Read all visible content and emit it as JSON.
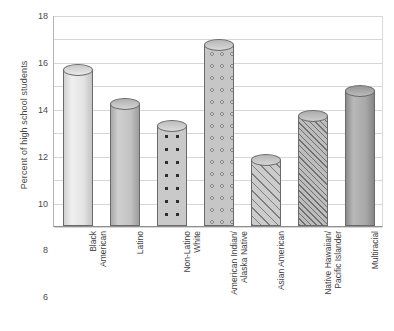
{
  "chart_data": {
    "type": "bar",
    "title": "",
    "xlabel": "",
    "ylabel": "Percent of high school students",
    "ylim": [
      0,
      18
    ],
    "ytick_step": 2,
    "grid": true,
    "legend": "none",
    "yticks": [
      "18",
      "16",
      "14",
      "12",
      "10",
      "8",
      "6",
      "4",
      "2",
      "0"
    ],
    "categories": [
      "Black American",
      "Latino",
      "Non-Latino White",
      "American Indian/ Alaska Native",
      "Asian American",
      "Native Hawaiian/ Pacific Islander",
      "Multiracial"
    ],
    "category_lines": [
      [
        "Black",
        "American"
      ],
      [
        "Latino"
      ],
      [
        "Non-Latino",
        "White"
      ],
      [
        "American Indian/",
        "Alaska Native"
      ],
      [
        "Asian American"
      ],
      [
        "Native Hawaiian/",
        "Pacific Islander"
      ],
      [
        "Multiracial"
      ]
    ],
    "values": [
      13.3,
      10.4,
      8.5,
      15.4,
      5.6,
      9.4,
      11.5
    ],
    "bar_fills": [
      "fill-lightgrad",
      "fill-midgrad",
      "fill-dots",
      "fill-circles",
      "fill-hatch",
      "fill-hatch-fine",
      "fill-darkgrad"
    ],
    "bar_caps": [
      "cap-lightgrad",
      "cap-midgrad",
      "cap-dots",
      "cap-circles",
      "cap-hatch",
      "cap-hatch-fine",
      "cap-darkgrad"
    ],
    "colors": {
      "gridline": "#d6d6d6",
      "axis": "#8f8f8f",
      "bar_outline": "#6a6a6a",
      "text": "#3f3f3f"
    }
  }
}
